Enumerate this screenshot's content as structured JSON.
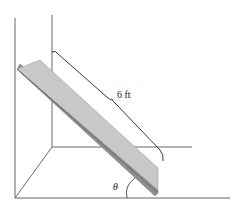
{
  "diagram": {
    "type": "ladder-against-wall",
    "labels": {
      "length": "6 ft",
      "angle": "θ"
    },
    "colors": {
      "lines": "#555555",
      "board_top": "#c8c8c8",
      "board_side": "#8e8e8e",
      "brace": "#222222"
    }
  }
}
